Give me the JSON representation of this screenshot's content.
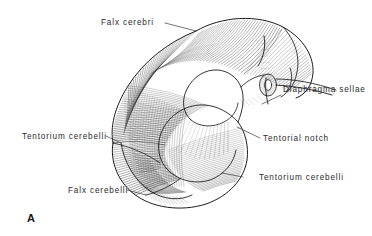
{
  "figure": {
    "panel_letter": "A",
    "background_color": "#ffffff",
    "ink_color": "#1c1c1c",
    "label_color": "#2b2b2b",
    "labels": [
      {
        "id": "falx-cerebri",
        "text": "Falx cerebri",
        "x": 101,
        "y": 25,
        "anchor": "start",
        "leader": "M 165 23 L 196 31"
      },
      {
        "id": "diaphragma-sellae",
        "text": "Diaphragma sellae",
        "x": 283,
        "y": 92,
        "anchor": "start",
        "leader": "M 281 95 L 262 104"
      },
      {
        "id": "tentorial-notch",
        "text": "Tentorial notch",
        "x": 263,
        "y": 141,
        "anchor": "start",
        "leader": "M 260 138 L 237 127"
      },
      {
        "id": "tentorium-cerebelli-left",
        "text": "Tentorium cerebelli",
        "x": 22,
        "y": 139,
        "anchor": "start",
        "leader": "M 106 136 L 121 143"
      },
      {
        "id": "tentorium-cerebelli-right",
        "text": "Tentorium cerebelli",
        "x": 259,
        "y": 180,
        "anchor": "start",
        "leader": "M 243 177 L 222 173"
      },
      {
        "id": "falx-cerebelli",
        "text": "Falx cerebelli",
        "x": 68,
        "y": 193,
        "anchor": "start",
        "leader": "M 127 190 L 146 195"
      }
    ]
  }
}
